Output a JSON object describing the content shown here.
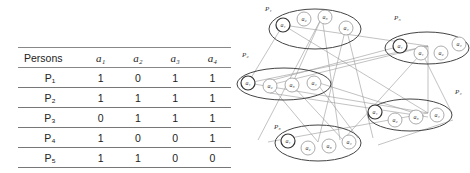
{
  "table": {
    "headers": [
      "Persons",
      "a1",
      "a2",
      "a3",
      "a4"
    ],
    "headers_display": [
      "Persons",
      "a₁",
      "a₂",
      "a₃",
      "a₄"
    ],
    "rows": [
      {
        "person": "P₁",
        "values": [
          "1",
          "0",
          "1",
          "1"
        ]
      },
      {
        "person": "P₂",
        "values": [
          "1",
          "1",
          "1",
          "1"
        ]
      },
      {
        "person": "P₃",
        "values": [
          "0",
          "1",
          "1",
          "1"
        ]
      },
      {
        "person": "P₄",
        "values": [
          "1",
          "0",
          "0",
          "1"
        ]
      },
      {
        "person": "P₅",
        "values": [
          "1",
          "1",
          "0",
          "0"
        ]
      }
    ]
  },
  "diagram": {
    "groups": [
      {
        "label": "P₁",
        "nodes": [
          "a₁",
          "a₂",
          "a₃",
          "a₄"
        ]
      },
      {
        "label": "P₅",
        "nodes": [
          "a₁",
          "a₁",
          "a₂",
          "a₄"
        ]
      },
      {
        "label": "P₂",
        "nodes": [
          "a₁",
          "a₂",
          "a₃",
          "a₄"
        ]
      },
      {
        "label": "P₄",
        "nodes": [
          "a₁",
          "a₂",
          "a₃",
          "a₄"
        ]
      },
      {
        "label": "P₃",
        "nodes": [
          "a₁",
          "a₂",
          "a₃",
          "a₄"
        ]
      }
    ]
  }
}
